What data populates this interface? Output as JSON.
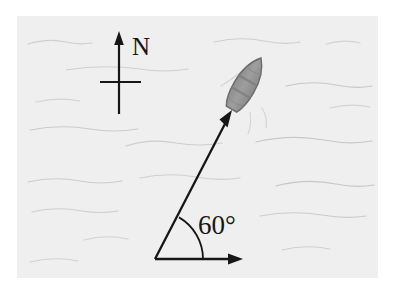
{
  "figure": {
    "name": "boat-bearing-diagram",
    "canvas": {
      "width": 404,
      "height": 295
    },
    "background_color": "#ffffff"
  },
  "water_panel": {
    "name": "water-surface",
    "x": 17,
    "y": 16,
    "width": 361,
    "height": 262,
    "fill_color": "#efefef",
    "wave_color": "#c9c9c9"
  },
  "compass": {
    "name": "north-indicator",
    "label": "N",
    "label_x": 132,
    "label_y": 54,
    "label_font_size": 25,
    "stroke_color": "#161616",
    "vertical_x": 119,
    "vertical_top_y": 33,
    "vertical_bottom_y": 114,
    "crossbar_y": 82,
    "crossbar_left_x": 100,
    "crossbar_right_x": 141
  },
  "vector": {
    "name": "heading-vector",
    "angle_label": "60°",
    "angle_degrees": 60,
    "label_x": 198,
    "label_y": 232,
    "label_font_size": 26,
    "stroke_color": "#161616",
    "origin_x": 155,
    "origin_y": 259,
    "tip_x": 232,
    "tip_y": 111
  },
  "baseline": {
    "name": "horizontal-reference-axis",
    "stroke_color": "#161616",
    "start_x": 155,
    "start_y": 259,
    "end_x": 242,
    "end_y": 259
  },
  "angle_arc": {
    "name": "angle-arc",
    "stroke_color": "#161616",
    "radius": 48,
    "center_x": 155,
    "center_y": 259
  },
  "boat": {
    "name": "boat-hull",
    "fill_color": "#9a9a9a",
    "outline_color": "#6b6b6b",
    "band_color": "#858585",
    "center_x": 246,
    "center_y": 84,
    "rotation_degrees": 30
  }
}
